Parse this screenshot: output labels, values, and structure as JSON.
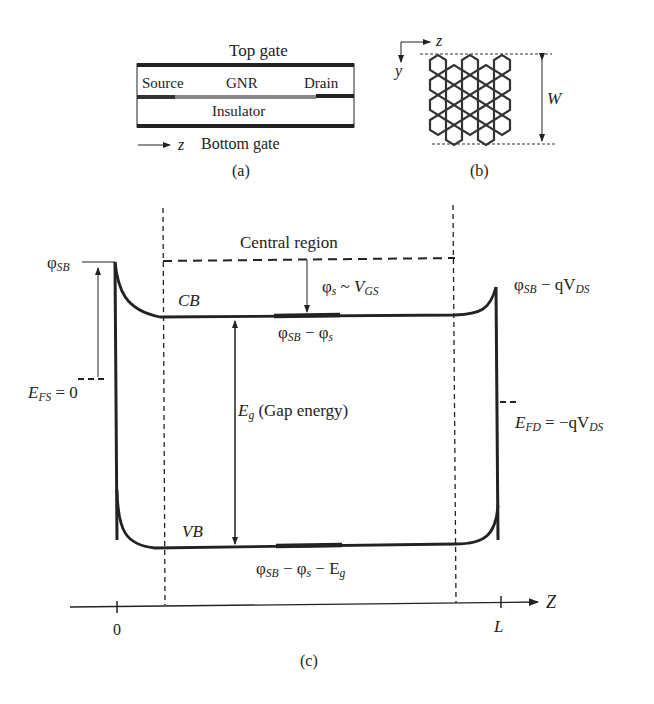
{
  "panel_a": {
    "caption": "(a)",
    "top_gate": "Top gate",
    "source": "Source",
    "gnr": "GNR",
    "drain": "Drain",
    "insulator": "Insulator",
    "axis": "z",
    "bottom_gate": "Bottom gate"
  },
  "panel_b": {
    "caption": "(b)",
    "axis_z": "z",
    "axis_y": "y",
    "width_label": "W"
  },
  "panel_c": {
    "caption": "(c)",
    "central_region": "Central region",
    "phi_sb": "φ",
    "phi_sb_sub": "SB",
    "phi_s_label": "φ",
    "phi_s_sub": "s",
    "phi_s_rel": " ~ ",
    "vgs": "V",
    "vgs_sub": "GS",
    "cb": "CB",
    "vb": "VB",
    "cb_mid": "φ",
    "cb_mid_sub": "SB",
    "cb_mid_rest": " − φ",
    "cb_mid_rest_sub": "s",
    "vb_mid_a": "φ",
    "vb_mid_a_sub": "SB",
    "vb_mid_b": " − φ",
    "vb_mid_b_sub": "s",
    "vb_mid_c": " − E",
    "vb_mid_c_sub": "g",
    "eg": "E",
    "eg_sub": "g",
    "eg_text": " (Gap energy)",
    "efs": "E",
    "efs_sub": "FS",
    "efs_val": " = 0",
    "right_top": "φ",
    "right_top_sub": "SB",
    "right_top_rest": " − qV",
    "right_top_rest_sub": "DS",
    "efd": "E",
    "efd_sub": "FD",
    "efd_rest": " = −qV",
    "efd_rest_sub": "DS",
    "axis_zero": "0",
    "axis_L": "L",
    "axis_Z": "Z"
  }
}
